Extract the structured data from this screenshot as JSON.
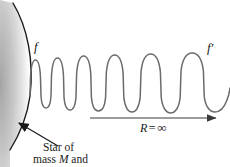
{
  "figure": {
    "background_color": "#ffffff",
    "labels": {
      "emitted_frequency": "f",
      "observed_frequency": "f′",
      "distance_symbol": "R",
      "distance_equals": "=",
      "distance_value": "∞",
      "caption_line_1": "Star of",
      "caption_line_2_prefix": "mass ",
      "caption_line_2_symbol": "M",
      "caption_line_2_suffix": " and"
    },
    "colors": {
      "wave_stroke": "#6b6b6b",
      "star_edge_stroke": "#1a1a1a",
      "arrow_stroke": "#3a3a3a",
      "pointer_stroke": "#1a1a1a",
      "star_fill_dark": "#b8b8b8",
      "star_fill_light": "#ffffff",
      "text": "#1a1a1a"
    },
    "star": {
      "name": "star-surface",
      "edge_path": "M 13 3 C 28 28, 34 62, 30 96 C 27 118, 20 134, 10 150",
      "gradient_stops": [
        "#a9a9a9",
        "#cfcfcf",
        "#ebebeb",
        "#ffffff"
      ]
    },
    "wave": {
      "name": "light-wave",
      "description": "transverse wave with wavelength increasing left to right",
      "path": "M 30 96 L 30.5 78 C 31 66 33 60 35.5 60 C 38 60 40 66 40.5 78 L 41 96 C 41.5 104 43.5 108 46 108 C 48.5 108 50.5 104 51 96 L 51.5 76 C 52.2 64 54.6 58 57.5 58 C 60.4 58 62.8 64 63.5 76 L 64 97 C 64.6 105.5 67 110 70 110 C 73 110 75.4 105.5 76 97 L 76.6 74 C 77.5 62 80.3 56 83.7 56 C 87.1 56 89.9 62 90.8 74 L 91.4 97 C 92.1 106 95 111 98.5 111 C 102 111 104.9 106 105.6 97 L 106.3 73 C 107.4 61 110.7 55 114.7 55 C 118.7 55 122 61 123.1 73 L 123.8 97 C 124.6 106.5 128 112 132 112 C 136 112 139.4 106.5 140.2 97 L 141 72 C 142.3 60 146.1 54 150.7 54 C 155.3 54 159.1 60 160.4 72 L 161.2 97 C 162.1 107 166 113 170.7 113 C 175.4 113 179.3 107 180.2 97 L 181 71 C 182.5 59 186.9 53 192.2 53 C 197.5 53 201.9 59 203.4 71 L 204.2 96 C 205.2 106 209.5 112 215 112 C 220 112 224 108 227 100 C 228.5 96 229.5 92 230 88"
    },
    "arrow": {
      "name": "distance-arrow",
      "x_start": 90,
      "x_end": 218,
      "y": 118
    },
    "pointer": {
      "name": "caption-pointer",
      "x_start": 58,
      "y_start": 146,
      "x_end": 17,
      "y_end": 122
    }
  }
}
